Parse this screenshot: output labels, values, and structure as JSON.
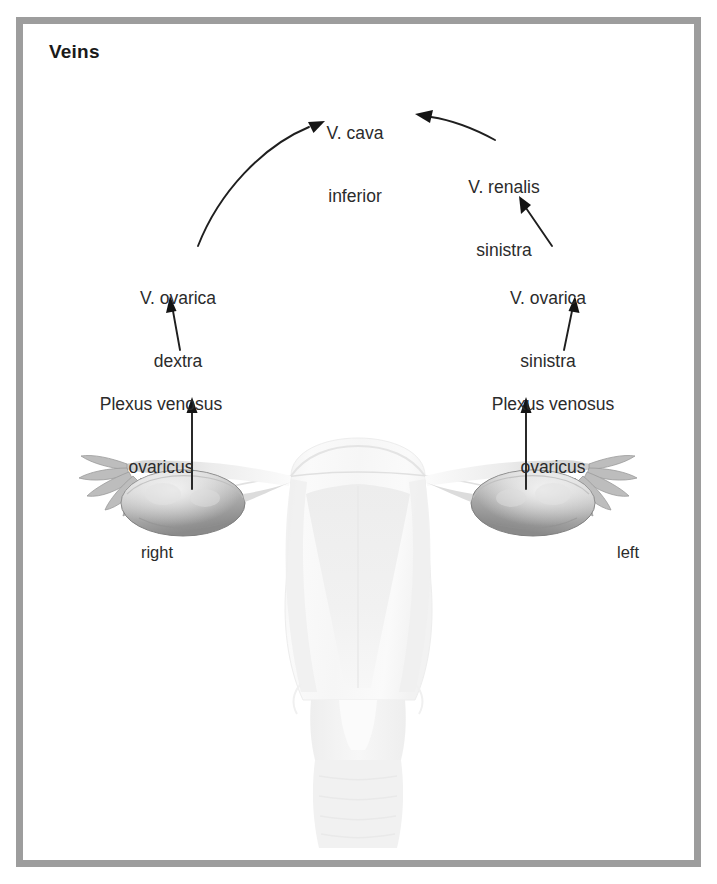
{
  "figure": {
    "title": "Veins",
    "border_color": "#9d9d9d",
    "background_color": "#ffffff",
    "text_color": "#2b2b2b"
  },
  "labels": {
    "cava_inferior": {
      "line1": "V. cava",
      "line2": "inferior"
    },
    "renalis_sinistra": {
      "line1": "V. renalis",
      "line2": "sinistra"
    },
    "ovarica_sinistra": {
      "line1": "V. ovarica",
      "line2": "sinistra"
    },
    "plexus_sinistra": {
      "line1": "Plexus venosus",
      "line2": "ovaricus"
    },
    "ovarica_dextra": {
      "line1": "V. ovarica",
      "line2": "dextra"
    },
    "plexus_dextra": {
      "line1": "Plexus venosus",
      "line2": "ovaricus"
    },
    "side_right": "right",
    "side_left": "left"
  },
  "diagram": {
    "type": "anatomical-flow",
    "illustration": "uterus-with-ovaries-and-uterine-tubes",
    "flow": [
      {
        "from": "Plexus venosus ovaricus (right)",
        "to": "V. ovarica dextra",
        "arrow": "straight-up"
      },
      {
        "from": "V. ovarica dextra",
        "to": "V. cava inferior",
        "arrow": "curved-up-right"
      },
      {
        "from": "Plexus venosus ovaricus (left)",
        "to": "V. ovarica sinistra",
        "arrow": "straight-up"
      },
      {
        "from": "V. ovarica sinistra",
        "to": "V. renalis sinistra",
        "arrow": "straight-up-left"
      },
      {
        "from": "V. renalis sinistra",
        "to": "V. cava inferior",
        "arrow": "curved-up-left"
      },
      {
        "from": "right ovary",
        "to": "Plexus venosus ovaricus (right)",
        "arrow": "straight-up"
      },
      {
        "from": "left ovary",
        "to": "Plexus venosus ovaricus (left)",
        "arrow": "straight-up"
      }
    ]
  }
}
